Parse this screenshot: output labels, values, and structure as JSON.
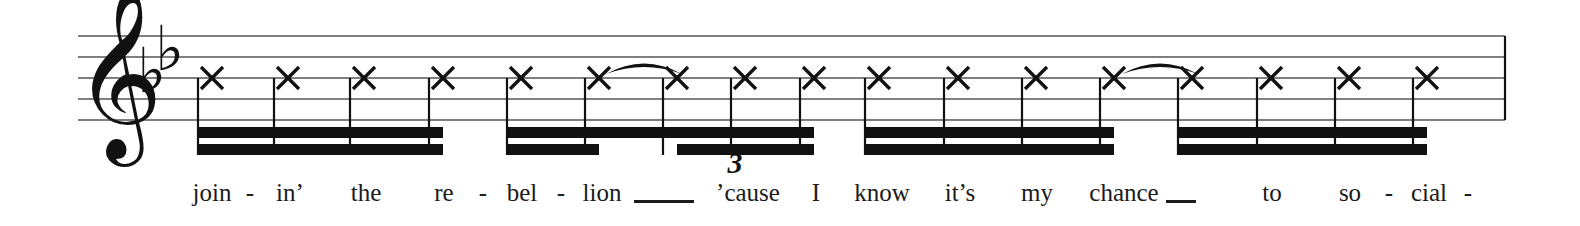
{
  "score": {
    "clef": "treble-clef",
    "clef_glyph": "𝄞",
    "key_signature": {
      "name": "B-flat major",
      "flat_glyph": "♭",
      "accidentals": [
        "B-flat",
        "E-flat"
      ],
      "count": 2
    },
    "notehead_style": "x-notehead",
    "notehead_glyph": "✕",
    "ink_color": "#111111",
    "staff_line_color": "#555555",
    "triplet_label": "3",
    "staff": {
      "left": 78,
      "right": 1505,
      "top_line_y": 36,
      "line_spacing": 21,
      "line_count": 5
    },
    "notes": [
      {
        "x": 212,
        "pitch_line": 3,
        "beam_group": 1,
        "value": "sixteenth"
      },
      {
        "x": 288,
        "pitch_line": 3,
        "beam_group": 1,
        "value": "sixteenth"
      },
      {
        "x": 364,
        "pitch_line": 3,
        "beam_group": 1,
        "value": "sixteenth"
      },
      {
        "x": 443,
        "pitch_line": 3,
        "beam_group": 1,
        "value": "sixteenth"
      },
      {
        "x": 521,
        "pitch_line": 3,
        "beam_group": 2,
        "value": "sixteenth"
      },
      {
        "x": 599,
        "pitch_line": 3,
        "beam_group": 2,
        "value": "eighth"
      },
      {
        "x": 677,
        "pitch_line": 3,
        "beam_group": 2,
        "value": "sixteenth"
      },
      {
        "x": 745,
        "pitch_line": 3,
        "beam_group": 2,
        "value": "sixteenth"
      },
      {
        "x": 814,
        "pitch_line": 3,
        "beam_group": 2,
        "value": "sixteenth"
      },
      {
        "x": 879,
        "pitch_line": 3,
        "beam_group": 3,
        "value": "sixteenth"
      },
      {
        "x": 958,
        "pitch_line": 3,
        "beam_group": 3,
        "value": "sixteenth"
      },
      {
        "x": 1036,
        "pitch_line": 3,
        "beam_group": 3,
        "value": "sixteenth"
      },
      {
        "x": 1114,
        "pitch_line": 3,
        "beam_group": 3,
        "value": "sixteenth"
      },
      {
        "x": 1192,
        "pitch_line": 3,
        "beam_group": 4,
        "value": "sixteenth"
      },
      {
        "x": 1271,
        "pitch_line": 3,
        "beam_group": 4,
        "value": "sixteenth"
      },
      {
        "x": 1349,
        "pitch_line": 3,
        "beam_group": 4,
        "value": "sixteenth"
      },
      {
        "x": 1427,
        "pitch_line": 3,
        "beam_group": 4,
        "value": "sixteenth"
      }
    ],
    "beams": [
      {
        "group": 1,
        "x1": 197,
        "x2": 443,
        "primary": true,
        "secondary_segments": [
          [
            197,
            443
          ]
        ]
      },
      {
        "group": 2,
        "x1": 506,
        "x2": 814,
        "primary": true,
        "secondary_segments": [
          [
            506,
            599
          ],
          [
            677,
            814
          ]
        ]
      },
      {
        "group": 3,
        "x1": 864,
        "x2": 1114,
        "primary": true,
        "secondary_segments": [
          [
            864,
            1114
          ]
        ]
      },
      {
        "group": 4,
        "x1": 1177,
        "x2": 1427,
        "primary": true,
        "secondary_segments": [
          [
            1177,
            1427
          ]
        ]
      }
    ],
    "slurs": [
      {
        "x1": 606,
        "x2": 682,
        "peak_y": 62
      },
      {
        "x1": 1122,
        "x2": 1198,
        "peak_y": 62
      }
    ],
    "barline": {
      "x": 1505
    }
  },
  "lyrics": {
    "syllables": [
      {
        "text": "join",
        "x": 212
      },
      {
        "text": "-",
        "x": 250,
        "hyphen": true
      },
      {
        "text": "in’",
        "x": 290
      },
      {
        "text": "the",
        "x": 366
      },
      {
        "text": "re",
        "x": 444
      },
      {
        "text": "-",
        "x": 483,
        "hyphen": true
      },
      {
        "text": "bel",
        "x": 522
      },
      {
        "text": "-",
        "x": 561,
        "hyphen": true
      },
      {
        "text": "lion",
        "x": 602
      },
      {
        "text": "’cause",
        "x": 748
      },
      {
        "text": "I",
        "x": 816
      },
      {
        "text": "know",
        "x": 882
      },
      {
        "text": "it’s",
        "x": 960
      },
      {
        "text": "my",
        "x": 1037
      },
      {
        "text": "chance",
        "x": 1124
      },
      {
        "text": "to",
        "x": 1272
      },
      {
        "text": "so",
        "x": 1350
      },
      {
        "text": "-",
        "x": 1389,
        "hyphen": true
      },
      {
        "text": "cial",
        "x": 1429
      },
      {
        "text": "-",
        "x": 1468,
        "hyphen": true
      }
    ],
    "extenders": [
      {
        "x": 634,
        "width": 60
      },
      {
        "x": 1166,
        "width": 30
      }
    ]
  }
}
